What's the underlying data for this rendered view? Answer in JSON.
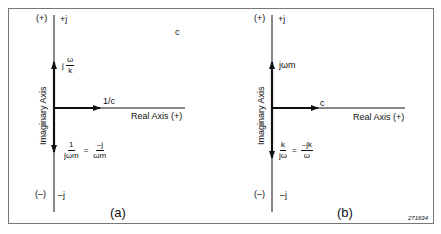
{
  "panel_a": {
    "top_sign": "(+)",
    "top_label": "+j",
    "bottom_sign": "(–)",
    "bottom_label": "–j",
    "y_axis_label": "Imaginary Axis",
    "x_axis_label": "Real Axis (+)",
    "corner_label": "c",
    "up_vector": {
      "prefix": "j",
      "num": "ω",
      "den": "k"
    },
    "right_vector": "1/c",
    "down_vector": {
      "lhs_num": "1",
      "lhs_den": "jωm",
      "eq": "=",
      "rhs_num": "–j",
      "rhs_den": "ωm"
    },
    "caption": "(a)"
  },
  "panel_b": {
    "top_sign": "(+)",
    "top_label": "+j",
    "bottom_sign": "(–)",
    "bottom_label": "–j",
    "y_axis_label": "Imaginary Axis",
    "x_axis_label": "Real Axis (+)",
    "up_vector": "jωm",
    "right_vector": "c",
    "down_vector": {
      "lhs_num": "k",
      "lhs_den": "jω",
      "eq": "=",
      "rhs_num": "–jk",
      "rhs_den": "ω"
    },
    "caption": "(b)"
  },
  "figure_number": "271634"
}
